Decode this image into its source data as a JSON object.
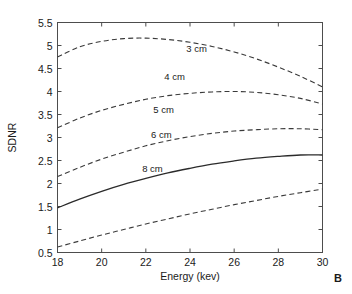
{
  "panel": {
    "label": "B"
  },
  "chart_data": {
    "type": "line",
    "title": "",
    "xlabel": "Energy (kev)",
    "ylabel": "SDNR",
    "xlim": [
      18,
      30
    ],
    "ylim": [
      0.5,
      5.5
    ],
    "xticks": [
      18,
      20,
      22,
      24,
      26,
      28,
      30
    ],
    "xticklabels": [
      "18",
      "20",
      "22",
      "24",
      "26",
      "28",
      "30"
    ],
    "yticks": [
      0.5,
      1,
      1.5,
      2,
      2.5,
      3,
      3.5,
      4,
      4.5,
      5,
      5.5
    ],
    "yticklabels": [
      "0.5",
      "1",
      "1.5",
      "2",
      "2.5",
      "3",
      "3.5",
      "4",
      "4.5",
      "5",
      "5.5"
    ],
    "grid": false,
    "legend": "inline-curve-labels",
    "x": [
      18,
      19,
      20,
      21,
      22,
      23,
      24,
      25,
      26,
      27,
      28,
      29,
      30
    ],
    "series": [
      {
        "name": "3 cm",
        "label": "3 cm",
        "style": "dashed",
        "color": "#3a3a3a",
        "label_x": 24.3,
        "label_y": 4.86,
        "values": [
          4.75,
          4.97,
          5.09,
          5.15,
          5.16,
          5.13,
          5.07,
          4.98,
          4.86,
          4.71,
          4.53,
          4.33,
          4.1
        ]
      },
      {
        "name": "4 cm",
        "label": "4 cm",
        "style": "dashed",
        "color": "#3a3a3a",
        "label_x": 23.3,
        "label_y": 4.25,
        "values": [
          3.21,
          3.42,
          3.59,
          3.72,
          3.83,
          3.91,
          3.96,
          3.99,
          4.0,
          3.98,
          3.93,
          3.85,
          3.73
        ]
      },
      {
        "name": "5 cm",
        "label": "5 cm",
        "style": "dashed",
        "color": "#3a3a3a",
        "label_x": 22.8,
        "label_y": 3.53,
        "values": [
          2.15,
          2.35,
          2.53,
          2.68,
          2.82,
          2.93,
          3.02,
          3.09,
          3.14,
          3.17,
          3.19,
          3.19,
          3.17
        ]
      },
      {
        "name": "6 cm",
        "label": "6 cm",
        "style": "solid",
        "color": "#2b2b2b",
        "label_x": 22.7,
        "label_y": 2.98,
        "values": [
          1.47,
          1.66,
          1.83,
          1.98,
          2.11,
          2.23,
          2.33,
          2.42,
          2.49,
          2.55,
          2.59,
          2.62,
          2.62
        ]
      },
      {
        "name": "8 cm",
        "label": "8 cm",
        "style": "dashed",
        "color": "#3a3a3a",
        "label_x": 22.3,
        "label_y": 2.26,
        "values": [
          0.62,
          0.75,
          0.88,
          1.0,
          1.12,
          1.23,
          1.34,
          1.44,
          1.54,
          1.63,
          1.72,
          1.8,
          1.88
        ]
      }
    ]
  }
}
